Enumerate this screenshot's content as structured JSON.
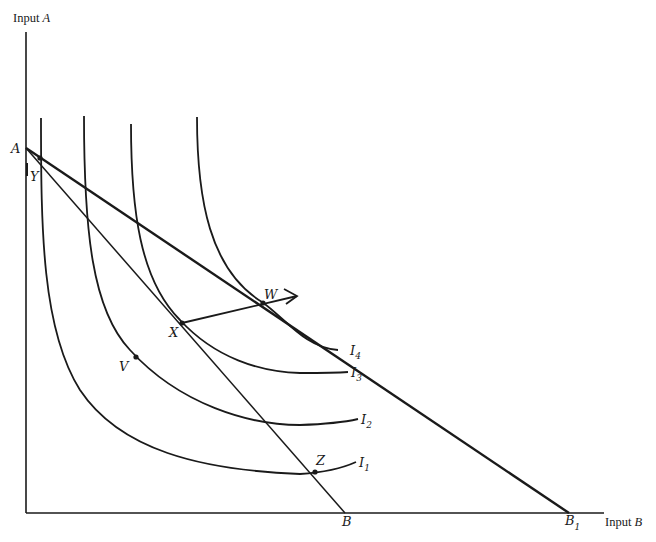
{
  "diagram": {
    "type": "isoquant-budget-diagram",
    "axes": {
      "y_label_prefix": "Input ",
      "y_label_var": "A",
      "x_label_prefix": "Input ",
      "x_label_var": "B"
    },
    "budget_lines": [
      {
        "id": "AB",
        "from": "A",
        "to": "B",
        "weight": "thin"
      },
      {
        "id": "AB1",
        "from": "A",
        "to": "B1",
        "weight": "thick"
      }
    ],
    "intercept_labels": {
      "A": "A",
      "B": "B",
      "B1_main": "B",
      "B1_sub": "1"
    },
    "curves": [
      {
        "id": "I1",
        "main": "I",
        "sub": "1"
      },
      {
        "id": "I2",
        "main": "I",
        "sub": "2"
      },
      {
        "id": "I3",
        "main": "I",
        "sub": "3"
      },
      {
        "id": "I4",
        "main": "I",
        "sub": "4"
      }
    ],
    "points": [
      {
        "id": "Y",
        "label": "Y",
        "on": "I1 / AB"
      },
      {
        "id": "V",
        "label": "V",
        "on": "I2"
      },
      {
        "id": "X",
        "label": "X",
        "on": "I3 / AB (tangency)"
      },
      {
        "id": "W",
        "label": "W",
        "on": "I4 / AB1 (tangency)"
      },
      {
        "id": "Z",
        "label": "Z",
        "on": "I1 / AB"
      }
    ],
    "expansion_path": {
      "from": "X",
      "through": "W",
      "arrow": true
    }
  }
}
